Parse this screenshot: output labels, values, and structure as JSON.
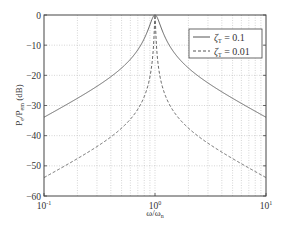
{
  "chart_data": {
    "type": "line",
    "title": "",
    "xlabel": "ω/ω",
    "xlabel_sub": "n",
    "ylabel": "P",
    "ylabel_sub": "e",
    "ylabel_mid": "/P",
    "ylabel_sub2": "em",
    "ylabel_unit": " (dB)",
    "xscale": "log",
    "xlim": [
      0.1,
      10
    ],
    "ylim": [
      -60,
      0
    ],
    "grid": true,
    "legend_position": "top-right",
    "x_ticks": [
      {
        "value": 0.1,
        "base": "10",
        "exp": "-1"
      },
      {
        "value": 1,
        "base": "10",
        "exp": "0"
      },
      {
        "value": 10,
        "base": "10",
        "exp": "1"
      }
    ],
    "y_ticks": [
      0,
      -10,
      -20,
      -30,
      -40,
      -50,
      -60
    ],
    "y_tick_labels": [
      "0",
      "−10",
      "−20",
      "−30",
      "−40",
      "−50",
      "−60"
    ],
    "series": [
      {
        "name": "ζT = 0.1",
        "label_symbol": "ζ",
        "label_sub": "T",
        "label_value": " = 0.1",
        "zeta": 0.1,
        "style": "solid",
        "points": [
          [
            0.1,
            -33.9
          ],
          [
            0.2,
            -27.8
          ],
          [
            0.5,
            -17.5
          ],
          [
            0.8,
            -9.0
          ],
          [
            1.0,
            0.0
          ],
          [
            1.25,
            -9.0
          ],
          [
            2,
            -17.5
          ],
          [
            5,
            -27.8
          ],
          [
            10,
            -33.9
          ]
        ]
      },
      {
        "name": "ζT = 0.01",
        "label_symbol": "ζ",
        "label_sub": "T",
        "label_value": " = 0.01",
        "zeta": 0.01,
        "style": "dashed",
        "points": [
          [
            0.1,
            -53.9
          ],
          [
            0.2,
            -47.8
          ],
          [
            0.5,
            -37.5
          ],
          [
            0.8,
            -27.5
          ],
          [
            1.0,
            0.0
          ],
          [
            1.25,
            -27.5
          ],
          [
            2,
            -37.5
          ],
          [
            5,
            -47.8
          ],
          [
            10,
            -53.9
          ]
        ]
      }
    ]
  }
}
